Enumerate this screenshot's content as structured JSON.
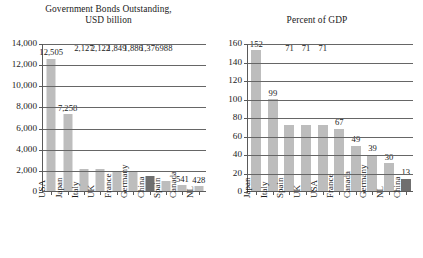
{
  "chart_data": [
    {
      "type": "bar",
      "title": "Government Bonds Outstanding,\nUSD billion",
      "xlabel": "",
      "ylabel": "",
      "ylim": [
        0,
        14000
      ],
      "yticks": [
        "0",
        "2,000",
        "4,000",
        "6,000",
        "8,000",
        "10,000",
        "12,000",
        "14,000"
      ],
      "ytick_values": [
        0,
        2000,
        4000,
        6000,
        8000,
        10000,
        12000,
        14000
      ],
      "grid": true,
      "legend": "none",
      "categories": [
        "USA",
        "Japan",
        "Italy",
        "UK",
        "France",
        "Germany",
        "China",
        "Spain",
        "Canada",
        "NL"
      ],
      "values": [
        12505,
        7258,
        2127,
        2122,
        1849,
        1886,
        1376,
        988,
        541,
        428
      ],
      "value_labels": [
        "12,505",
        "7,258",
        "2,127",
        "2,122",
        "1,849",
        "1,886",
        "1,376",
        "988",
        "541",
        "428"
      ],
      "highlight_category": "China",
      "colors": {
        "bar": "#bdbdbd",
        "highlight": "#6f6f6f",
        "axis": "#5a5a5a",
        "grid": "#666666"
      }
    },
    {
      "type": "bar",
      "title": "Percent of GDP",
      "xlabel": "",
      "ylabel": "",
      "ylim": [
        0,
        160
      ],
      "yticks": [
        "0",
        "20",
        "40",
        "60",
        "80",
        "100",
        "120",
        "140",
        "160"
      ],
      "ytick_values": [
        0,
        20,
        40,
        60,
        80,
        100,
        120,
        140,
        160
      ],
      "grid": true,
      "legend": "none",
      "categories": [
        "Japan",
        "Italy",
        "Spain",
        "UK",
        "USA",
        "France",
        "Canada",
        "Germany",
        "NL",
        "China"
      ],
      "values": [
        152,
        99,
        71,
        71,
        71,
        67,
        49,
        39,
        30,
        13
      ],
      "value_labels": [
        "152",
        "99",
        "71",
        "71",
        "71",
        "67",
        "49",
        "39",
        "30",
        "13"
      ],
      "highlight_category": "China",
      "colors": {
        "bar": "#bdbdbd",
        "highlight": "#6f6f6f",
        "axis": "#5a5a5a",
        "grid": "#666666"
      }
    }
  ]
}
